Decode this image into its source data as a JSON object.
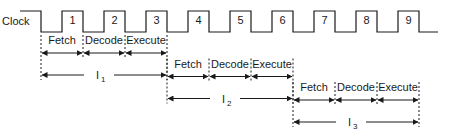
{
  "diagram": {
    "clock": {
      "label": "Clock",
      "cycles": [
        "1",
        "2",
        "3",
        "4",
        "5",
        "6",
        "7",
        "8",
        "9"
      ]
    },
    "stages": [
      "Fetch",
      "Decode",
      "Execute"
    ],
    "instructions": [
      {
        "name": "I",
        "sub": "1",
        "start_cycle": 1,
        "stages": [
          "Fetch",
          "Decode",
          "Execute"
        ]
      },
      {
        "name": "I",
        "sub": "2",
        "start_cycle": 4,
        "stages": [
          "Fetch",
          "Decode",
          "Execute"
        ]
      },
      {
        "name": "I",
        "sub": "3",
        "start_cycle": 7,
        "stages": [
          "Fetch",
          "Decode",
          "Execute"
        ]
      }
    ],
    "colors": {
      "ink": "#1a1a1a",
      "background": "#ffffff"
    }
  }
}
